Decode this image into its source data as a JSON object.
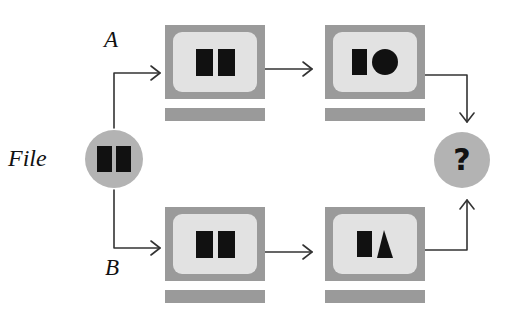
{
  "diagram": {
    "colors": {
      "node_gray": "#b3b3b3",
      "monitor_bezel": "#9a9a9a",
      "monitor_screen": "#e2e2e2",
      "shape_black": "#111111",
      "arrow": "#333333",
      "background": "#ffffff"
    },
    "labels": {
      "file": "File",
      "branch_a": "A",
      "branch_b": "B",
      "merge": "?"
    },
    "nodes": {
      "source": {
        "name": "file-node",
        "label": "File",
        "shape": "circle",
        "contents": [
          "rectangle",
          "rectangle"
        ]
      },
      "branch_a_step1": {
        "name": "monitor-a1",
        "shape": "monitor",
        "contents": [
          "rectangle",
          "rectangle"
        ]
      },
      "branch_a_step2": {
        "name": "monitor-a2",
        "shape": "monitor",
        "contents": [
          "rectangle",
          "circle"
        ]
      },
      "branch_b_step1": {
        "name": "monitor-b1",
        "shape": "monitor",
        "contents": [
          "rectangle",
          "rectangle"
        ]
      },
      "branch_b_step2": {
        "name": "monitor-b2",
        "shape": "monitor",
        "contents": [
          "rectangle",
          "triangle"
        ]
      },
      "merge": {
        "name": "merge-node",
        "label": "?",
        "shape": "circle",
        "contents": [
          "question-mark"
        ]
      }
    },
    "edges": [
      {
        "from": "file",
        "to": "branch_a_step1",
        "style": "elbow-up-right",
        "label": "A"
      },
      {
        "from": "file",
        "to": "branch_b_step1",
        "style": "elbow-down-right",
        "label": "B"
      },
      {
        "from": "branch_a_step1",
        "to": "branch_a_step2",
        "style": "straight-right",
        "label": ""
      },
      {
        "from": "branch_b_step1",
        "to": "branch_b_step2",
        "style": "straight-right",
        "label": ""
      },
      {
        "from": "branch_a_step2",
        "to": "merge",
        "style": "elbow-right-down",
        "label": ""
      },
      {
        "from": "branch_b_step2",
        "to": "merge",
        "style": "elbow-right-up",
        "label": ""
      }
    ]
  }
}
